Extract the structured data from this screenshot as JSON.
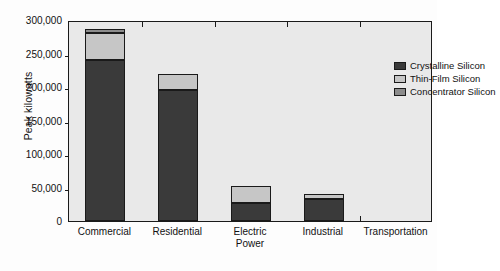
{
  "chart_data": {
    "type": "bar",
    "subtype": "stacked-vertical",
    "title": "",
    "xlabel": "",
    "ylabel": "Peak kilowatts",
    "categories": [
      "Commercial",
      "Residential",
      "Electric Power",
      "Industrial",
      "Transportation"
    ],
    "category_lines": [
      [
        "Commercial"
      ],
      [
        "Residential"
      ],
      [
        "Electric",
        "Power"
      ],
      [
        "Industrial"
      ],
      [
        "Transportation"
      ]
    ],
    "ylim": [
      0,
      300000
    ],
    "ytick_values": [
      0,
      50000,
      100000,
      150000,
      200000,
      250000,
      300000
    ],
    "ytick_labels": [
      "0",
      "50,000",
      "100,000",
      "150,000",
      "200,000",
      "250,000",
      "300,000"
    ],
    "grid": false,
    "legend_position": "upper right",
    "series": [
      {
        "name": "Crystalline Silicon",
        "color": "#3a3a3a",
        "values": [
          240000,
          195000,
          27000,
          33000,
          0
        ]
      },
      {
        "name": "Thin-Film Silicon",
        "color": "#c6c6c6",
        "values": [
          41000,
          25000,
          25000,
          8000,
          0
        ]
      },
      {
        "name": "Concentrator Silicon",
        "color": "#8c8c8c",
        "values": [
          6000,
          0,
          0,
          0,
          0
        ]
      }
    ],
    "totals": [
      287000,
      220000,
      52000,
      41000,
      0
    ]
  },
  "legend": {
    "items": [
      {
        "label": "Crystalline Silicon"
      },
      {
        "label": "Thin-Film Silicon"
      },
      {
        "label": "Concentrator Silicon"
      }
    ]
  },
  "colors": {
    "crystalline": "#3a3a3a",
    "thin_film": "#c6c6c6",
    "concentrator": "#8c8c8c",
    "plot_background": "#e9e9e9",
    "axis": "#1a1a1a",
    "page_background": "#fdfdfd"
  }
}
